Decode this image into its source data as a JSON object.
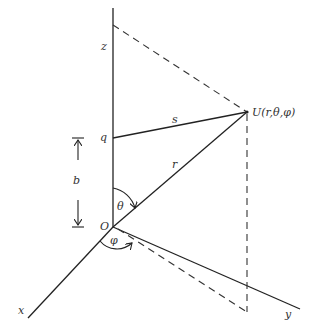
{
  "figure": {
    "labels": {
      "z_axis": "z",
      "x_axis": "x",
      "y_axis": "y",
      "origin": "O",
      "point_q": "q",
      "point_U": "U(r,θ,φ)",
      "segment_s": "s",
      "segment_r": "r",
      "distance_b": "b",
      "angle_theta": "θ",
      "angle_phi": "φ"
    },
    "colors": {
      "line": "#222222",
      "text": "#333333",
      "background": "#ffffff"
    }
  }
}
